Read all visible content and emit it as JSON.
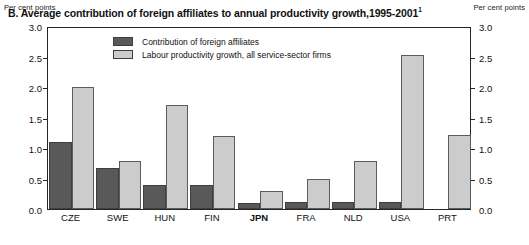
{
  "axis": {
    "unit_caption_left": "Per cent points",
    "unit_caption_right": "Per cent points",
    "ticks": [
      "3.0",
      "2.5",
      "2.0",
      "1.5",
      "1.0",
      "0.5",
      "0.0"
    ]
  },
  "title": {
    "text": "B. Average contribution of foreign affiliates to annual productivity growth,1995-2001",
    "footnote_marker": "1"
  },
  "legend": {
    "items": [
      {
        "label": "Contribution of foreign affiliates",
        "color": "#595959"
      },
      {
        "label": "Labour productivity growth, all service-sector firms",
        "color": "#cccccc"
      }
    ]
  },
  "chart_data": {
    "type": "bar",
    "title": "B. Average contribution of foreign affiliates to annual productivity growth,1995-2001",
    "xlabel": "",
    "ylabel": "Per cent points",
    "ylim": [
      0,
      3.0
    ],
    "ytick_step": 0.5,
    "grid": false,
    "legend_position": "inside-top-center",
    "categories": [
      "CZE",
      "SWE",
      "HUN",
      "FIN",
      "JPN",
      "FRA",
      "NLD",
      "USA",
      "PRT"
    ],
    "highlighted_category": "JPN",
    "series": [
      {
        "name": "Contribution of foreign affiliates",
        "color": "#595959",
        "values": [
          1.1,
          0.67,
          0.4,
          0.4,
          0.1,
          0.11,
          0.11,
          0.12,
          0.0
        ]
      },
      {
        "name": "Labour productivity growth, all service-sector firms",
        "color": "#cccccc",
        "values": [
          2.0,
          0.78,
          1.7,
          1.2,
          0.3,
          0.5,
          0.78,
          2.52,
          1.22
        ]
      }
    ]
  }
}
